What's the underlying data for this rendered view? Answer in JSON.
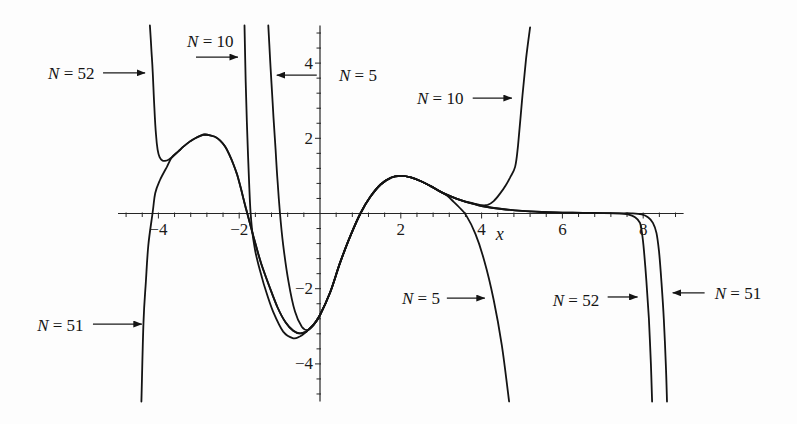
{
  "figure": {
    "background": "#fdfdfd",
    "line_color": "#141414"
  },
  "chart_data": {
    "type": "line",
    "title": "",
    "xlabel": "x",
    "ylabel": "",
    "xlim": [
      -5,
      9
    ],
    "ylim": [
      -5,
      5
    ],
    "grid": false,
    "legend": null,
    "x_ticks": {
      "major": [
        -4,
        -2,
        2,
        4,
        6,
        8
      ],
      "labels": [
        "−4",
        "−2",
        "2",
        "4",
        "6",
        "8"
      ],
      "minor_step": 0.4
    },
    "y_ticks": {
      "major": [
        4,
        2,
        -2,
        -4
      ],
      "labels": [
        "4",
        "2",
        "−2",
        "−4"
      ],
      "minor_step": 0.4
    },
    "series": [
      {
        "name": "N = 5",
        "x": [
          -1.28,
          -1.24,
          -1.2,
          -1.15,
          -1.1,
          -1.05,
          -0.99,
          -0.91,
          -0.78,
          -0.62,
          -0.45,
          -0.3,
          -0.15,
          0,
          0.25,
          0.5,
          0.75,
          1.0,
          1.25,
          1.5,
          1.75,
          2.0,
          2.25,
          2.5,
          2.75,
          3.0,
          3.15,
          3.3,
          3.45,
          3.62,
          3.85,
          4.07,
          4.3,
          4.5,
          4.68
        ],
        "y": [
          5.0,
          4.2,
          3.46,
          2.55,
          1.7,
          0.85,
          0.0,
          -0.84,
          -1.81,
          -2.61,
          -3.01,
          -3.1,
          -2.95,
          -2.7,
          -2.1,
          -1.3,
          -0.6,
          0.0,
          0.45,
          0.77,
          0.95,
          1.0,
          0.96,
          0.86,
          0.72,
          0.57,
          0.47,
          0.32,
          0.16,
          -0.05,
          -0.55,
          -1.27,
          -2.3,
          -3.5,
          -5.0
        ]
      },
      {
        "name": "N = 10",
        "x": [
          -1.87,
          -1.84,
          -1.81,
          -1.78,
          -1.75,
          -1.72,
          -1.68,
          -1.62,
          -1.55,
          -1.45,
          -1.36,
          -1.16,
          -0.91,
          -0.66,
          -0.5,
          -0.4,
          -0.3,
          -0.15,
          0,
          0.25,
          0.5,
          0.75,
          1.0,
          1.25,
          1.5,
          1.75,
          2.0,
          2.25,
          2.5,
          2.75,
          3.0,
          3.25,
          3.5,
          3.75,
          4.0,
          4.15,
          4.3,
          4.45,
          4.6,
          4.7,
          4.83,
          4.9,
          5.0,
          5.1,
          5.2
        ],
        "y": [
          5.0,
          3.5,
          2.4,
          1.5,
          0.7,
          0.05,
          -0.45,
          -0.9,
          -1.25,
          -1.65,
          -1.99,
          -2.61,
          -3.14,
          -3.32,
          -3.27,
          -3.2,
          -3.1,
          -2.95,
          -2.7,
          -2.1,
          -1.3,
          -0.6,
          0.0,
          0.45,
          0.77,
          0.95,
          1.0,
          0.96,
          0.86,
          0.72,
          0.57,
          0.45,
          0.35,
          0.28,
          0.22,
          0.23,
          0.33,
          0.52,
          0.75,
          0.95,
          1.24,
          1.8,
          3.0,
          4.1,
          4.95
        ]
      },
      {
        "name": "N = 51",
        "x": [
          -4.42,
          -4.37,
          -4.31,
          -4.25,
          -4.14,
          -4.08,
          -3.96,
          -3.79,
          -3.67,
          -3.5,
          -3.38,
          -3.2,
          -3.09,
          -2.95,
          -2.85,
          -2.72,
          -2.6,
          -2.47,
          -2.35,
          -2.25,
          -2.15,
          -2.06,
          -1.98,
          -1.9,
          -1.85,
          -1.8,
          -1.7,
          -1.6,
          -1.45,
          -1.25,
          -1.05,
          -0.85,
          -0.66,
          -0.5,
          -0.35,
          -0.3,
          -0.15,
          0,
          0.25,
          0.5,
          0.75,
          1.0,
          1.25,
          1.5,
          1.75,
          2.0,
          2.25,
          2.5,
          2.75,
          3.0,
          3.25,
          3.5,
          3.75,
          4.0,
          4.5,
          5.0,
          5.5,
          6.0,
          6.5,
          7.0,
          7.4,
          7.7,
          7.96,
          8.12,
          8.24,
          8.33,
          8.39,
          8.45,
          8.51,
          8.56,
          8.59
        ],
        "y": [
          -5.0,
          -2.89,
          -1.8,
          -0.85,
          0.04,
          0.54,
          0.89,
          1.24,
          1.49,
          1.66,
          1.78,
          1.93,
          2.0,
          2.07,
          2.1,
          2.08,
          2.04,
          1.94,
          1.78,
          1.58,
          1.33,
          1.06,
          0.76,
          0.42,
          0.2,
          0.0,
          -0.4,
          -0.8,
          -1.35,
          -1.95,
          -2.5,
          -2.9,
          -3.12,
          -3.19,
          -3.15,
          -3.1,
          -2.95,
          -2.7,
          -2.1,
          -1.3,
          -0.6,
          0.0,
          0.45,
          0.77,
          0.95,
          1.0,
          0.96,
          0.86,
          0.72,
          0.57,
          0.45,
          0.35,
          0.27,
          0.2,
          0.12,
          0.07,
          0.04,
          0.025,
          0.015,
          0.01,
          0.006,
          0.004,
          -0.02,
          -0.1,
          -0.25,
          -0.52,
          -1.0,
          -1.8,
          -2.8,
          -4.0,
          -5.0
        ]
      },
      {
        "name": "N = 52",
        "x": [
          -4.21,
          -4.17,
          -4.14,
          -4.1,
          -4.06,
          -4.02,
          -3.97,
          -3.9,
          -3.84,
          -3.75,
          -3.67,
          -3.5,
          -3.38,
          -3.2,
          -3.09,
          -2.95,
          -2.85,
          -2.72,
          -2.6,
          -2.47,
          -2.35,
          -2.25,
          -2.15,
          -2.06,
          -1.98,
          -1.9,
          -1.85,
          -1.8,
          -1.7,
          -1.6,
          -1.45,
          -1.25,
          -1.05,
          -0.85,
          -0.66,
          -0.5,
          -0.35,
          -0.3,
          -0.15,
          0,
          0.25,
          0.5,
          0.75,
          1.0,
          1.25,
          1.5,
          1.75,
          2.0,
          2.25,
          2.5,
          2.75,
          3.0,
          3.25,
          3.5,
          3.75,
          4.0,
          4.5,
          5.0,
          5.5,
          6.0,
          6.5,
          7.0,
          7.4,
          7.62,
          7.8,
          7.92,
          7.97,
          8.02,
          8.08,
          8.14,
          8.19,
          8.22
        ],
        "y": [
          5.0,
          4.3,
          3.77,
          2.8,
          2.1,
          1.7,
          1.5,
          1.41,
          1.4,
          1.43,
          1.49,
          1.66,
          1.78,
          1.93,
          2.0,
          2.07,
          2.1,
          2.08,
          2.04,
          1.94,
          1.78,
          1.58,
          1.33,
          1.06,
          0.76,
          0.42,
          0.2,
          0.0,
          -0.4,
          -0.8,
          -1.35,
          -1.95,
          -2.5,
          -2.9,
          -3.12,
          -3.19,
          -3.15,
          -3.1,
          -2.95,
          -2.7,
          -2.1,
          -1.3,
          -0.6,
          0.0,
          0.45,
          0.77,
          0.95,
          1.0,
          0.96,
          0.86,
          0.72,
          0.57,
          0.45,
          0.35,
          0.27,
          0.2,
          0.12,
          0.07,
          0.04,
          0.025,
          0.015,
          0.01,
          0.006,
          -0.02,
          -0.1,
          -0.25,
          -0.52,
          -1.0,
          -1.8,
          -2.8,
          -4.0,
          -5.0
        ]
      }
    ],
    "annotations": [
      {
        "text": "N = 52",
        "series": "N = 52",
        "text_x": -6.73,
        "text_y": 3.74,
        "arrow_from": [
          -5.37,
          3.74
        ],
        "arrow_to": [
          -4.33,
          3.74
        ]
      },
      {
        "text": "N = 10",
        "series": "N = 10",
        "text_x": -3.29,
        "text_y": 4.59,
        "arrow_from": [
          -3.07,
          4.16
        ],
        "arrow_to": [
          -2.03,
          4.16
        ]
      },
      {
        "text": "N = 5",
        "series": "N = 5",
        "text_x": 0.47,
        "text_y": 3.68,
        "arrow_from": [
          -0.08,
          3.68
        ],
        "arrow_to": [
          -1.07,
          3.68
        ]
      },
      {
        "text": "N = 10",
        "series": "N = 10",
        "text_x": 2.4,
        "text_y": 3.07,
        "arrow_from": [
          3.78,
          3.07
        ],
        "arrow_to": [
          4.75,
          3.07
        ]
      },
      {
        "text": "N = 51",
        "series": "N = 51",
        "text_x": -7.0,
        "text_y": -2.96,
        "arrow_from": [
          -5.62,
          -2.94
        ],
        "arrow_to": [
          -4.41,
          -2.94
        ]
      },
      {
        "text": "N = 5",
        "series": "N = 5",
        "text_x": 2.03,
        "text_y": -2.25,
        "arrow_from": [
          3.14,
          -2.25
        ],
        "arrow_to": [
          4.08,
          -2.25
        ]
      },
      {
        "text": "N = 52",
        "series": "N = 52",
        "text_x": 5.76,
        "text_y": -2.3,
        "arrow_from": [
          7.12,
          -2.22
        ],
        "arrow_to": [
          7.86,
          -2.22
        ]
      },
      {
        "text": "N = 51",
        "series": "N = 51",
        "text_x": 9.77,
        "text_y": -2.11,
        "arrow_from": [
          9.52,
          -2.11
        ],
        "arrow_to": [
          8.73,
          -2.11
        ]
      }
    ]
  }
}
